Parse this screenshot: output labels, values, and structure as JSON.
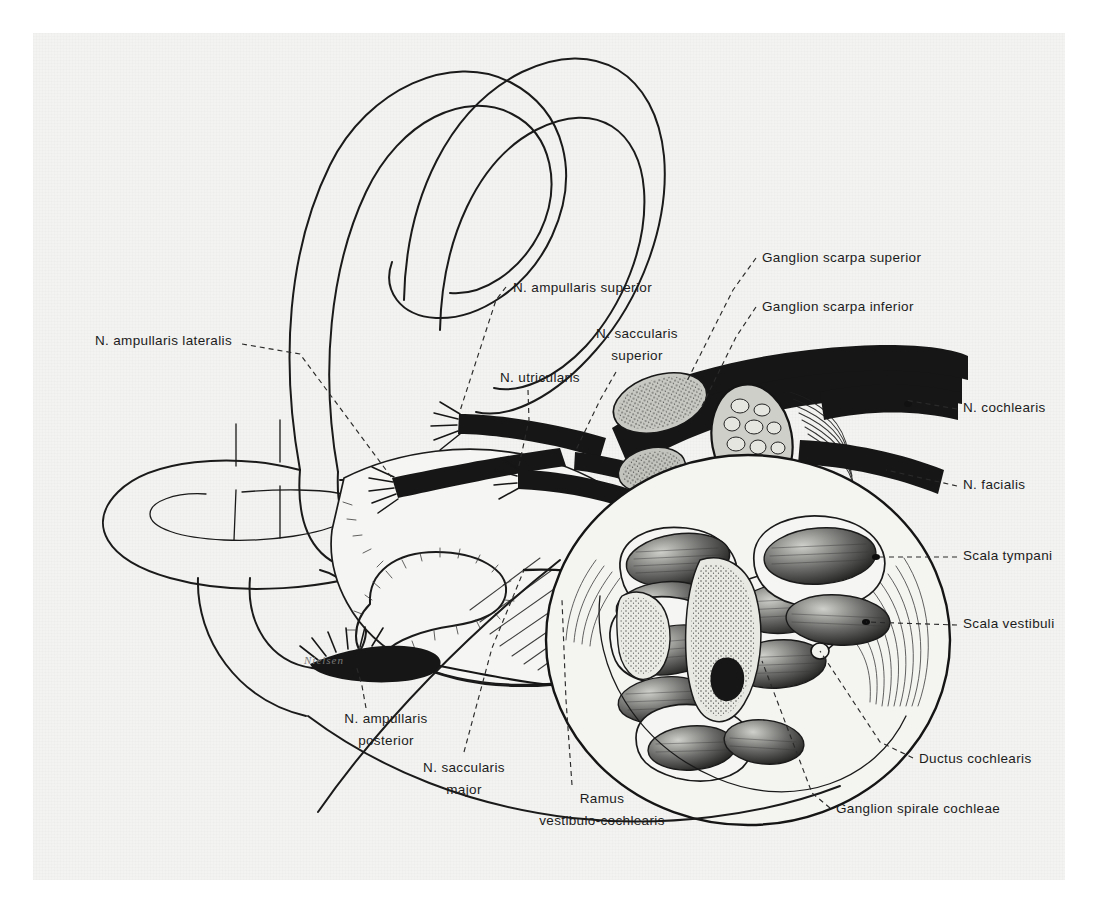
{
  "figure": {
    "kind": "anatomical-illustration",
    "style": "black-and-white stipple / line engraving on off-white plate",
    "signature": "Nielsen"
  },
  "labels": [
    {
      "id": "n-ampullaris-lateralis",
      "lines": [
        "N. ampullaris lateralis"
      ],
      "anchor": "end",
      "text_x": 232,
      "text_y": 345,
      "line_height": 22,
      "leader": "M242,344 L300,354 L392,478"
    },
    {
      "id": "n-ampullaris-superior",
      "lines": [
        "N. ampullaris superior"
      ],
      "anchor": "start",
      "text_x": 513,
      "text_y": 292,
      "line_height": 22,
      "leader": "M506,287 L496,300 L459,414"
    },
    {
      "id": "n-saccularis-superior",
      "lines": [
        "N. saccularis",
        "superior"
      ],
      "anchor": "middle",
      "text_x": 637,
      "text_y": 338,
      "line_height": 22,
      "leader": "M616,372 L600,400 L575,452"
    },
    {
      "id": "n-utricularis",
      "lines": [
        "N. utricularis"
      ],
      "anchor": "start",
      "text_x": 500,
      "text_y": 382,
      "line_height": 22,
      "leader": "M528,390 L529,420 L518,470"
    },
    {
      "id": "ganglion-scarpa-superior",
      "lines": [
        "Ganglion scarpa superior"
      ],
      "anchor": "start",
      "text_x": 762,
      "text_y": 262,
      "line_height": 22,
      "leader": "M756,258 L733,290 L686,383"
    },
    {
      "id": "ganglion-scarpa-inferior",
      "lines": [
        "Ganglion scarpa inferior"
      ],
      "anchor": "start",
      "text_x": 762,
      "text_y": 311,
      "line_height": 22,
      "leader": "M756,307 L736,337 L700,410"
    },
    {
      "id": "n-cochlearis",
      "lines": [
        "N. cochlearis"
      ],
      "anchor": "start",
      "text_x": 963,
      "text_y": 412,
      "line_height": 22,
      "leader": "M957,409 L905,400"
    },
    {
      "id": "n-facialis",
      "lines": [
        "N. facialis"
      ],
      "anchor": "start",
      "text_x": 963,
      "text_y": 489,
      "line_height": 22,
      "leader": "M957,486 L886,470"
    },
    {
      "id": "scala-tympani",
      "lines": [
        "Scala tympani"
      ],
      "anchor": "start",
      "text_x": 963,
      "text_y": 560,
      "line_height": 22,
      "leader": "M957,557 L876,557"
    },
    {
      "id": "scala-vestibuli",
      "lines": [
        "Scala vestibuli"
      ],
      "anchor": "start",
      "text_x": 963,
      "text_y": 628,
      "line_height": 22,
      "leader": "M957,625 L866,622"
    },
    {
      "id": "ductus-cochlearis",
      "lines": [
        "Ductus cochlearis"
      ],
      "anchor": "start",
      "text_x": 919,
      "text_y": 763,
      "line_height": 22,
      "leader": "M913,758 L880,742 L820,651"
    },
    {
      "id": "ganglion-spirale-cochleae",
      "lines": [
        "Ganglion spirale cochleae"
      ],
      "anchor": "start",
      "text_x": 836,
      "text_y": 813,
      "line_height": 22,
      "leader": "M830,808 L812,793 L762,661"
    },
    {
      "id": "n-ampullaris-posterior",
      "lines": [
        "N. ampullaris",
        "posterior"
      ],
      "anchor": "middle",
      "text_x": 386,
      "text_y": 723,
      "line_height": 22,
      "leader": "M366,708 L362,686 L356,665"
    },
    {
      "id": "n-saccularis-major",
      "lines": [
        "N. saccularis",
        "major"
      ],
      "anchor": "middle",
      "text_x": 464,
      "text_y": 772,
      "line_height": 22,
      "leader": "M464,752 L492,648 L524,570"
    },
    {
      "id": "ramus-vestibulo-cochlearis",
      "lines": [
        "Ramus",
        "vestibulo-cochlearis"
      ],
      "anchor": "middle",
      "text_x": 602,
      "text_y": 803,
      "line_height": 22,
      "leader": "M572,785 L566,700 L562,600"
    }
  ],
  "colors": {
    "paper": "#f3f3f1",
    "ink": "#161616",
    "label_text": "#1c1c1c",
    "leader": "#2a2a2a",
    "signature": "#7a7a78",
    "page_margin": "#ffffff"
  }
}
